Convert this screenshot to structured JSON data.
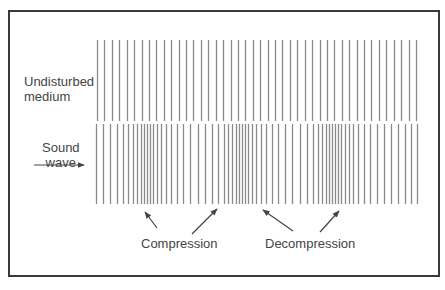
{
  "figure": {
    "labels": {
      "undisturbed_line1": "Undisturbed",
      "undisturbed_line2": "medium",
      "sound_line1": "Sound",
      "sound_line2": "wave",
      "compression": "Compression",
      "decompression": "Decompression"
    },
    "colors": {
      "line": "#8a8a8a",
      "border": "#3a3a3a",
      "text": "#444444",
      "arrow": "#444444"
    },
    "rows": {
      "undisturbed": {
        "y_top": 40,
        "y_bottom": 121,
        "x_start": 97,
        "x_end": 416,
        "count": 44
      },
      "sound_wave": {
        "y_top": 124,
        "y_bottom": 204,
        "x_start": 96,
        "x_end": 417
      }
    },
    "sound_wave_x": [
      96,
      103,
      110,
      117,
      123,
      128,
      133,
      137,
      141,
      144,
      147,
      150,
      153,
      157,
      161,
      166,
      171,
      177,
      183,
      190,
      198,
      205,
      212,
      218,
      224,
      228,
      232,
      236,
      239,
      242,
      245,
      248,
      252,
      256,
      261,
      266,
      272,
      278,
      285,
      292,
      300,
      307,
      313,
      318,
      322,
      326,
      329,
      332,
      335,
      338,
      341,
      345,
      349,
      353,
      358,
      364,
      370,
      377,
      384,
      391,
      398,
      405,
      411,
      417
    ],
    "arrows": [
      {
        "name": "compression-arrow-left",
        "x1": 157,
        "y1": 228,
        "x2": 145,
        "y2": 212
      },
      {
        "name": "compression-arrow-right",
        "x1": 192,
        "y1": 234,
        "x2": 217,
        "y2": 209
      },
      {
        "name": "decompression-arrow-left",
        "x1": 293,
        "y1": 231,
        "x2": 263,
        "y2": 210
      },
      {
        "name": "decompression-arrow-right",
        "x1": 320,
        "y1": 232,
        "x2": 339,
        "y2": 211
      },
      {
        "name": "sound-wave-direction-arrow",
        "x1": 34,
        "y1": 165,
        "x2": 84,
        "y2": 165
      }
    ]
  }
}
